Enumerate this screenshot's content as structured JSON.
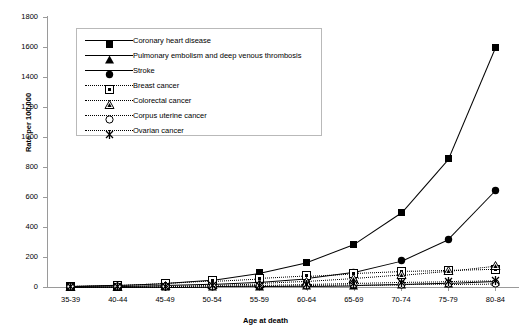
{
  "chart_data": {
    "type": "line",
    "title": "",
    "xlabel": "Age at death",
    "ylabel": "Rate per 100,000",
    "categories": [
      "35-39",
      "40-44",
      "45-49",
      "50-54",
      "55-59",
      "60-64",
      "65-69",
      "70-74",
      "75-79",
      "80-84"
    ],
    "ylim": [
      0,
      1800
    ],
    "ytick_values": [
      0,
      200,
      400,
      600,
      800,
      1000,
      1200,
      1400,
      1600,
      1800
    ],
    "ytick_labels": [
      "0",
      "200",
      "400",
      "600",
      "800",
      "1000",
      "1200",
      "1400",
      "1600",
      "1800"
    ],
    "grid": false,
    "legend_position": "upper-left-inside",
    "series": [
      {
        "name": "Coronary heart disease",
        "marker": "filled-square",
        "line": "solid",
        "values": [
          6,
          14,
          26,
          48,
          95,
          165,
          285,
          495,
          855,
          1600
        ]
      },
      {
        "name": "Pulmonary embolism and deep venous thrombosis",
        "marker": "filled-triangle",
        "line": "solid",
        "values": [
          1,
          2,
          3,
          4,
          6,
          8,
          12,
          18,
          26,
          40
        ]
      },
      {
        "name": "Stroke",
        "marker": "filled-circle",
        "line": "solid",
        "values": [
          4,
          7,
          12,
          20,
          34,
          58,
          100,
          175,
          320,
          645
        ]
      },
      {
        "name": "Breast cancer",
        "marker": "open-square",
        "line": "dotted",
        "values": [
          5,
          12,
          25,
          42,
          58,
          75,
          92,
          105,
          112,
          120
        ]
      },
      {
        "name": "Colorectal cancer",
        "marker": "open-triangle",
        "line": "dotted",
        "values": [
          2,
          4,
          8,
          14,
          24,
          38,
          58,
          82,
          110,
          145
        ]
      },
      {
        "name": "Corpus uterine cancer",
        "marker": "open-circle",
        "line": "dotted",
        "values": [
          0.5,
          1,
          2,
          4,
          7,
          11,
          15,
          19,
          22,
          25
        ]
      },
      {
        "name": "Ovarian cancer",
        "marker": "star-x",
        "line": "dotted",
        "values": [
          1,
          2,
          4,
          8,
          13,
          19,
          26,
          33,
          38,
          42
        ]
      }
    ]
  }
}
